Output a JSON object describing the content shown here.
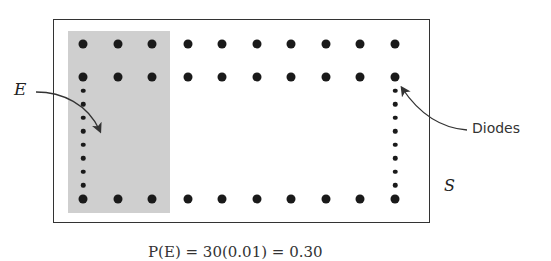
{
  "figure": {
    "labels": {
      "event": "E",
      "sample_space": "S",
      "diodes": "Diodes"
    },
    "caption_partial": "P(E) = 30(0.01) = 0.30",
    "grid": {
      "columns": 10,
      "column_x": [
        83,
        118,
        152,
        188,
        222,
        257,
        291,
        326,
        360,
        395
      ],
      "top_row_y": 44,
      "second_row_y": 77,
      "bottom_row_y": 199,
      "side_small_dots": 8
    },
    "shaded_region": {
      "label": "E",
      "covers_columns": 3,
      "color": "#cfcfcf"
    },
    "colors": {
      "dot": "#1a1a1a",
      "frame": "#333333",
      "shade": "#cfcfcf"
    }
  }
}
